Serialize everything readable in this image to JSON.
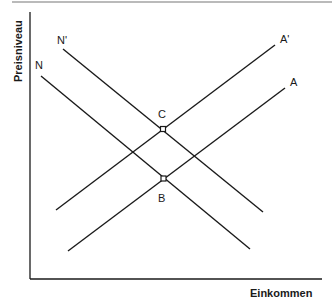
{
  "diagram": {
    "y_axis_label": "Preisniveau",
    "x_axis_label": "Einkommen",
    "curves": [
      {
        "id": "N",
        "label": "N",
        "type": "downward"
      },
      {
        "id": "N_prime",
        "label": "N'",
        "type": "downward"
      },
      {
        "id": "A",
        "label": "A",
        "type": "upward"
      },
      {
        "id": "A_prime",
        "label": "A'",
        "type": "upward"
      }
    ],
    "points": [
      {
        "id": "C",
        "label": "C",
        "intersection": [
          "N'",
          "A'"
        ]
      },
      {
        "id": "B",
        "label": "B",
        "intersection": [
          "N",
          "A"
        ]
      }
    ],
    "line_color": "#1a1a1a"
  }
}
